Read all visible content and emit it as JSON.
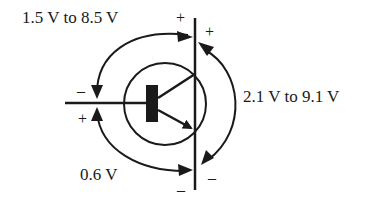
{
  "diagram": {
    "type": "bjt-npn-voltage-diagram",
    "labels": {
      "vbc_range": "1.5 V to 8.5 V",
      "vce_range": "2.1 V to 9.1 V",
      "vbe": "0.6 V"
    },
    "signs": {
      "collector_top_left": "+",
      "collector_top_right": "+",
      "base_top": "–",
      "base_bottom": "+",
      "emitter_bottom_left": "–",
      "emitter_bottom_right": "–"
    },
    "colors": {
      "ink": "#1a1a1a",
      "background": "#ffffff"
    }
  }
}
